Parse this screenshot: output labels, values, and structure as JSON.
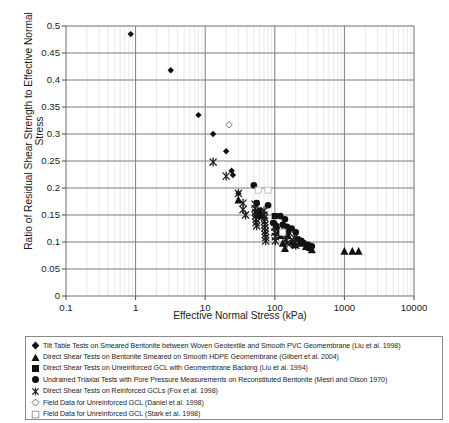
{
  "axes": {
    "ylabel": "Ratio of Residual Shear Strength to Effective Normal Stress",
    "xlabel": "Effective Normal Stress (kPa)",
    "yticks": [
      "0.5",
      "0.45",
      "0.4",
      "0.35",
      "0.3",
      "0.25",
      "0.2",
      "0.15",
      "0.1",
      "0.05",
      "0"
    ],
    "xticks": [
      "0.1",
      "1",
      "10",
      "100",
      "1000",
      "10000"
    ]
  },
  "legend": {
    "items": [
      {
        "marker": "filled-diamond",
        "label": "Tilt Table Tests on Smeared Bentonite between Woven Geotextile and Smooth PVC Geomembrane (Liu et al. 1998)"
      },
      {
        "marker": "filled-triangle",
        "label": "Direct Shear Tests on Bentonite Smeared on Smooth HDPE Geomembrane (Gilbert et al. 2004)"
      },
      {
        "marker": "filled-square",
        "label": "Direct Shear Tests on Unreinforced GCL with Geomembrane Backing (Liu et al. 1994)"
      },
      {
        "marker": "filled-circle",
        "label": "Undrained Triaxial Tests with Pore Pressure Measurements on Reconstituted Bentonite (Mesri and Olson 1970)"
      },
      {
        "marker": "x-mark",
        "label": "Direct Shear Tests on Reinforced GCLs (Fox et al. 1998)"
      },
      {
        "marker": "open-diamond",
        "label": "Field Data for Unreinforced GCL (Daniel et al. 1998)"
      },
      {
        "marker": "open-square",
        "label": "Field Data for Unreinforced GCL (Stark et al. 1998)"
      }
    ]
  },
  "chart_data": {
    "type": "scatter",
    "title": "",
    "xlabel": "Effective Normal Stress (kPa)",
    "ylabel": "Ratio of Residual Shear Strength to Effective Normal Stress",
    "xscale": "log",
    "xlim": [
      0.1,
      10000
    ],
    "ylim": [
      0,
      0.5
    ],
    "ytick_step": 0.05,
    "grid": true,
    "legend_position": "below-plot",
    "series": [
      {
        "name": "Tilt Table Tests on Smeared Bentonite between Woven Geotextile and Smooth PVC Geomembrane (Liu et al. 1998)",
        "marker": "filled-diamond",
        "color": "#101010",
        "points": [
          [
            0.85,
            0.485
          ],
          [
            3.2,
            0.418
          ],
          [
            8.0,
            0.335
          ],
          [
            13.0,
            0.3
          ],
          [
            20.0,
            0.268
          ],
          [
            24.0,
            0.232
          ],
          [
            25.0,
            0.224
          ],
          [
            30.0,
            0.19
          ]
        ]
      },
      {
        "name": "Direct Shear Tests on Bentonite Smeared on Smooth HDPE Geomembrane (Gilbert et al. 2004)",
        "marker": "filled-triangle",
        "color": "#101010",
        "points": [
          [
            30.0,
            0.178
          ],
          [
            105.0,
            0.132
          ],
          [
            115.0,
            0.12
          ],
          [
            120.0,
            0.112
          ],
          [
            130.0,
            0.098
          ],
          [
            140.0,
            0.088
          ],
          [
            155.0,
            0.112
          ],
          [
            175.0,
            0.1
          ],
          [
            190.0,
            0.095
          ],
          [
            230.0,
            0.098
          ],
          [
            280.0,
            0.092
          ],
          [
            320.0,
            0.09
          ],
          [
            340.0,
            0.086
          ],
          [
            1000.0,
            0.083
          ],
          [
            1300.0,
            0.083
          ],
          [
            1600.0,
            0.083
          ]
        ]
      },
      {
        "name": "Direct Shear Tests on Unreinforced GCL with Geomembrane Backing (Liu et al. 1994)",
        "marker": "filled-square",
        "color": "#101010",
        "points": [
          [
            55.0,
            0.152
          ],
          [
            100.0,
            0.148
          ],
          [
            105.0,
            0.128
          ]
        ]
      },
      {
        "name": "Undrained Triaxial Tests with Pore Pressure Measurements on Reconstituted Bentonite (Mesri and Olson 1970)",
        "marker": "filled-circle",
        "color": "#101010",
        "points": [
          [
            50.0,
            0.205
          ],
          [
            55.0,
            0.172
          ],
          [
            60.0,
            0.158
          ],
          [
            62.0,
            0.148
          ],
          [
            80.0,
            0.168
          ],
          [
            95.0,
            0.135
          ],
          [
            120.0,
            0.148
          ],
          [
            130.0,
            0.132
          ],
          [
            140.0,
            0.142
          ],
          [
            150.0,
            0.128
          ],
          [
            155.0,
            0.118
          ],
          [
            175.0,
            0.125
          ],
          [
            200.0,
            0.118
          ],
          [
            215.0,
            0.105
          ],
          [
            240.0,
            0.102
          ],
          [
            260.0,
            0.098
          ],
          [
            300.0,
            0.095
          ],
          [
            340.0,
            0.092
          ]
        ]
      },
      {
        "name": "Direct Shear Tests on Reinforced GCLs (Fox et al. 1998)",
        "marker": "x-mark",
        "color": "#1a1a1a",
        "points": [
          [
            13.0,
            0.248
          ],
          [
            20.0,
            0.222
          ],
          [
            30.0,
            0.19
          ],
          [
            35.0,
            0.172
          ],
          [
            35.0,
            0.16
          ],
          [
            38.0,
            0.15
          ],
          [
            52.0,
            0.17
          ],
          [
            52.0,
            0.162
          ],
          [
            53.0,
            0.155
          ],
          [
            53.0,
            0.148
          ],
          [
            54.0,
            0.142
          ],
          [
            54.0,
            0.136
          ],
          [
            55.0,
            0.13
          ],
          [
            70.0,
            0.158
          ],
          [
            70.0,
            0.15
          ],
          [
            71.0,
            0.145
          ],
          [
            71.0,
            0.138
          ],
          [
            72.0,
            0.132
          ],
          [
            72.0,
            0.126
          ],
          [
            73.0,
            0.12
          ],
          [
            73.0,
            0.114
          ],
          [
            74.0,
            0.108
          ],
          [
            74.0,
            0.102
          ],
          [
            100.0,
            0.128
          ],
          [
            100.0,
            0.118
          ],
          [
            102.0,
            0.11
          ],
          [
            102.0,
            0.102
          ],
          [
            140.0,
            0.12
          ],
          [
            142.0,
            0.112
          ],
          [
            144.0,
            0.104
          ],
          [
            150.0,
            0.098
          ],
          [
            190.0,
            0.108
          ],
          [
            195.0,
            0.1
          ],
          [
            200.0,
            0.094
          ]
        ]
      },
      {
        "name": "Field Data for Unreinforced GCL (Daniel et al. 1998)",
        "marker": "open-diamond",
        "color": "#6a6a6a",
        "points": [
          [
            22.0,
            0.317
          ]
        ]
      },
      {
        "name": "Field Data for Unreinforced GCL (Stark et al. 1998)",
        "marker": "open-square",
        "color": "#bdbdbd",
        "points": [
          [
            58.0,
            0.196
          ],
          [
            80.0,
            0.196
          ],
          [
            130.0,
            0.118
          ]
        ]
      }
    ]
  }
}
